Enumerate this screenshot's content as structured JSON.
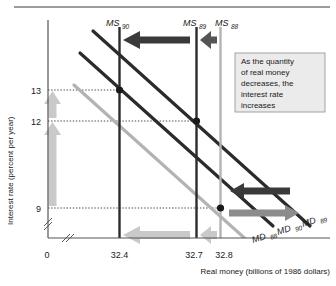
{
  "figure": {
    "type": "economics-money-market-diagram",
    "top_rule": true
  },
  "axes": {
    "y": {
      "title": "Interest rate (percent per year)",
      "ticks": [
        {
          "value": 13,
          "label": "13"
        },
        {
          "value": 12,
          "label": "12"
        },
        {
          "value": 9,
          "label": "9"
        }
      ],
      "break_mark": true
    },
    "x": {
      "title": "Real money (billions of 1986 dollars)",
      "origin_label": "0",
      "ticks": [
        {
          "value": 32.4,
          "label": "32.4"
        },
        {
          "value": 32.7,
          "label": "32.7"
        },
        {
          "value": 32.8,
          "label": "32.8"
        }
      ],
      "break_mark": true
    }
  },
  "supply_curves": [
    {
      "name": "MS90",
      "label": "MS",
      "sub": "90",
      "x": 32.4,
      "color": "#2b2b2b"
    },
    {
      "name": "MS89",
      "label": "MS",
      "sub": "89",
      "x": 32.7,
      "color": "#2b2b2b"
    },
    {
      "name": "MS88",
      "label": "MS",
      "sub": "88",
      "x": 32.8,
      "color": "#b3b3b3"
    }
  ],
  "demand_curves": [
    {
      "name": "MD88",
      "label": "MD",
      "sub": "88",
      "color": "#b3b3b3"
    },
    {
      "name": "MD90",
      "label": "MD",
      "sub": "90",
      "color": "#2b2b2b"
    },
    {
      "name": "MD89",
      "label": "MD",
      "sub": "89",
      "color": "#2b2b2b"
    }
  ],
  "equilibria": [
    {
      "x": 32.4,
      "y": 13,
      "curves": "MS90-MD90"
    },
    {
      "x": 32.7,
      "y": 12,
      "curves": "MS89-MD89"
    },
    {
      "x": 32.8,
      "y": 9,
      "curves": "MS88-MD88"
    }
  ],
  "annotation": {
    "lines": [
      "As the quantity",
      "of real money",
      "decreases, the",
      "interest rate",
      "increases"
    ]
  },
  "arrows": {
    "supply_shift_top": [
      {
        "direction": "left",
        "color": "#2b2b2b",
        "from_x": 32.7,
        "to_x": 32.4
      },
      {
        "direction": "left",
        "color": "#2b2b2b",
        "from_x": 32.8,
        "to_x": 32.7
      }
    ],
    "supply_shift_bottom": [
      {
        "direction": "left",
        "color": "#c9c9c9",
        "from_x": 32.7,
        "to_x": 32.4
      },
      {
        "direction": "left",
        "color": "#c9c9c9",
        "from_x": 32.8,
        "to_x": 32.7
      }
    ],
    "interest_rate_rise": [
      {
        "direction": "up",
        "color": "#c9c9c9",
        "from_y": 12,
        "to_y": 13
      },
      {
        "direction": "up",
        "color": "#c9c9c9",
        "from_y": 9,
        "to_y": 12
      }
    ],
    "demand_shift": [
      {
        "direction": "left",
        "color": "#3a3a3a"
      },
      {
        "direction": "right",
        "color": "#8c8c8c"
      }
    ]
  },
  "colors": {
    "dark": "#2b2b2b",
    "light_gray": "#b3b3b3",
    "arrow_light": "#c9c9c9",
    "arrow_dark": "#3a3a3a",
    "note_bg": "#ebebeb",
    "note_border": "#9a9a9a",
    "axis": "#555555",
    "dotted": "#333333"
  }
}
